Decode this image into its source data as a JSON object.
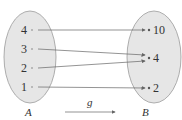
{
  "diagram": {
    "function_label": "g",
    "domain": {
      "name": "A",
      "elements": [
        "4",
        "3",
        "2",
        "1"
      ]
    },
    "codomain": {
      "name": "B",
      "elements": [
        "10",
        "4",
        "2"
      ]
    },
    "mappings": [
      {
        "from": "4",
        "to": "10"
      },
      {
        "from": "3",
        "to": "4"
      },
      {
        "from": "2",
        "to": "4"
      },
      {
        "from": "1",
        "to": "2"
      }
    ],
    "colors": {
      "ellipse_fill": "#e6e6e6",
      "ellipse_stroke": "#9a9a9a",
      "arrow": "#666666",
      "text": "#333333"
    }
  }
}
